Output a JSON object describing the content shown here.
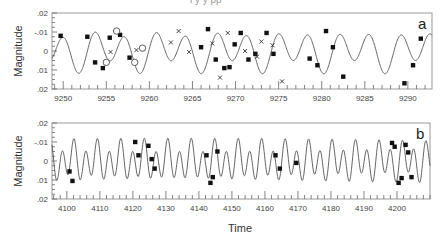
{
  "figure": {
    "xlabel": "Time",
    "header_fragment": "l  y   y pp"
  },
  "chart_data": [
    {
      "type": "line",
      "panel_label": "a",
      "title": "",
      "xlabel": "",
      "ylabel": "Magnitude",
      "xlim": [
        9248.7,
        9292.8
      ],
      "ylim": [
        0.02,
        -0.02
      ],
      "y_inverted": true,
      "xticks": [
        9250,
        9255,
        9260,
        9265,
        9270,
        9275,
        9280,
        9285,
        9290
      ],
      "xtick_labels": [
        "9250",
        "9255",
        "9260",
        "9265",
        "9270",
        "9275",
        "9280",
        "9285",
        "9290"
      ],
      "yticks": [
        -0.02,
        -0.01,
        0,
        0.01,
        0.02
      ],
      "ytick_labels": [
        ".02",
        "-.01",
        "0",
        ".01",
        ".02"
      ],
      "grid": false,
      "model_curve": {
        "description": "two-frequency sinusoidal fit",
        "components": [
          {
            "period": 3.55,
            "amplitude": 0.0085,
            "phase": 0.6
          },
          {
            "period": 7.2,
            "amplitude": 0.0035,
            "phase": 2.1
          }
        ]
      },
      "series": [
        {
          "name": "filled squares",
          "marker": "square",
          "points": [
            [
              9249.7,
              -0.008
            ],
            [
              9252.8,
              -0.0075
            ],
            [
              9253.7,
              0.006
            ],
            [
              9254.6,
              0.009
            ],
            [
              9255.4,
              -0.007
            ],
            [
              9256.6,
              -0.0085
            ],
            [
              9257.7,
              0.0035
            ],
            [
              9266.0,
              -0.002
            ],
            [
              9266.8,
              -0.0115
            ],
            [
              9267.7,
              0.0045
            ],
            [
              9268.7,
              0.009
            ],
            [
              9269.3,
              0.0085
            ],
            [
              9269.9,
              -0.0035
            ],
            [
              9270.6,
              -0.0095
            ],
            [
              9271.5,
              0.0045
            ],
            [
              9272.3,
              0.0015
            ],
            [
              9273.6,
              -0.0095
            ],
            [
              9274.4,
              0.0015
            ],
            [
              9278.6,
              0.004
            ],
            [
              9279.5,
              0.0075
            ],
            [
              9280.5,
              -0.0105
            ],
            [
              9281.3,
              -0.002
            ],
            [
              9282.5,
              0.0135
            ],
            [
              9289.6,
              0.017
            ],
            [
              9290.6,
              0.0075
            ],
            [
              9291.5,
              -0.0065
            ]
          ]
        },
        {
          "name": "open circles",
          "marker": "circle",
          "points": [
            [
              9255.0,
              0.006
            ],
            [
              9256.2,
              -0.0105
            ],
            [
              9258.3,
              0.006
            ],
            [
              9259.2,
              -0.0015
            ]
          ]
        },
        {
          "name": "crosses",
          "marker": "x",
          "points": [
            [
              9255.5,
              0.0005
            ],
            [
              9258.5,
              -0.0005
            ],
            [
              9262.5,
              -0.0045
            ],
            [
              9263.4,
              -0.0105
            ],
            [
              9264.6,
              0.0005
            ],
            [
              9267.3,
              -0.004
            ],
            [
              9268.2,
              0.014
            ],
            [
              9269.1,
              -0.0095
            ],
            [
              9271.1,
              0.0
            ],
            [
              9272.5,
              0.003
            ],
            [
              9273.0,
              -0.005
            ],
            [
              9274.3,
              -0.003
            ],
            [
              9275.4,
              0.016
            ]
          ]
        }
      ]
    },
    {
      "type": "line",
      "panel_label": "b",
      "title": "",
      "xlabel": "Time",
      "ylabel": "Magnitude",
      "xlim": [
        4095.5,
        4210
      ],
      "ylim": [
        0.02,
        -0.02
      ],
      "y_inverted": true,
      "xticks": [
        4100,
        4110,
        4120,
        4130,
        4140,
        4150,
        4160,
        4170,
        4180,
        4190,
        4200
      ],
      "xtick_labels": [
        "4100",
        "4110",
        "4120",
        "4130",
        "4140",
        "4150",
        "4160",
        "4170",
        "4180",
        "4190",
        "4200"
      ],
      "yticks": [
        -0.02,
        -0.01,
        0,
        0.01,
        0.02
      ],
      "ytick_labels": [
        ".02",
        "-.01",
        "0",
        ".01",
        ".02"
      ],
      "grid": false,
      "model_curve": {
        "description": "two-frequency sinusoidal fit",
        "components": [
          {
            "period": 3.55,
            "amplitude": 0.0085,
            "phase": 1.3
          },
          {
            "period": 7.2,
            "amplitude": 0.0035,
            "phase": 0.4
          }
        ]
      },
      "series": [
        {
          "name": "filled squares",
          "marker": "square",
          "points": [
            [
              4100.8,
              0.0055
            ],
            [
              4101.7,
              0.0105
            ],
            [
              4120.7,
              -0.01
            ],
            [
              4121.7,
              -0.003
            ],
            [
              4124.7,
              -0.008
            ],
            [
              4125.7,
              -0.001
            ],
            [
              4126.6,
              0.004
            ],
            [
              4142.3,
              -0.003
            ],
            [
              4143.5,
              0.0115
            ],
            [
              4144.2,
              0.0085
            ],
            [
              4145.6,
              -0.005
            ],
            [
              4163.2,
              -0.003
            ],
            [
              4164.5,
              0.004
            ],
            [
              4169.5,
              0.001
            ],
            [
              4198.5,
              -0.0095
            ],
            [
              4199.3,
              -0.0075
            ],
            [
              4200.5,
              0.0115
            ],
            [
              4201.4,
              0.009
            ],
            [
              4202.6,
              -0.0085
            ],
            [
              4203.4,
              -0.0045
            ],
            [
              4204.4,
              0.0085
            ]
          ]
        }
      ]
    }
  ]
}
